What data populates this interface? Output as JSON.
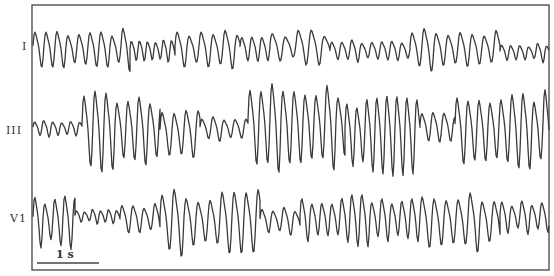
{
  "figure": {
    "background": "#ffffff",
    "trace_color": "#3a3a3a",
    "frame_color": "#444444",
    "frame": {
      "left": 32,
      "top": 5,
      "right": 549,
      "bottom": 270
    }
  },
  "leads": [
    {
      "label": "I",
      "label_pos": {
        "x": 22,
        "y": 40
      },
      "baseline_y": 48,
      "segments": [
        {
          "x0": 33,
          "x1": 130,
          "period": 11,
          "amp": 18,
          "bias": 0
        },
        {
          "x0": 130,
          "x1": 175,
          "period": 8,
          "amp": 10,
          "bias": 2
        },
        {
          "x0": 175,
          "x1": 240,
          "period": 12,
          "amp": 18,
          "bias": 0
        },
        {
          "x0": 240,
          "x1": 270,
          "period": 10,
          "amp": 12,
          "bias": 0
        },
        {
          "x0": 270,
          "x1": 330,
          "period": 13,
          "amp": 14,
          "bias": -2
        },
        {
          "x0": 330,
          "x1": 410,
          "period": 10,
          "amp": 9,
          "bias": 2
        },
        {
          "x0": 410,
          "x1": 500,
          "period": 12,
          "amp": 17,
          "bias": 0
        },
        {
          "x0": 500,
          "x1": 549,
          "period": 9,
          "amp": 8,
          "bias": 4
        }
      ]
    },
    {
      "label": "III",
      "label_pos": {
        "x": 6,
        "y": 124
      },
      "baseline_y": 128,
      "segments": [
        {
          "x0": 33,
          "x1": 82,
          "period": 9,
          "amp": 7,
          "bias": 0
        },
        {
          "x0": 82,
          "x1": 160,
          "period": 11,
          "amp": 36,
          "bias": 0
        },
        {
          "x0": 160,
          "x1": 200,
          "period": 12,
          "amp": 22,
          "bias": 4
        },
        {
          "x0": 200,
          "x1": 248,
          "period": 11,
          "amp": 10,
          "bias": 0
        },
        {
          "x0": 248,
          "x1": 345,
          "period": 11,
          "amp": 38,
          "bias": -4
        },
        {
          "x0": 345,
          "x1": 420,
          "period": 10,
          "amp": 32,
          "bias": 4
        },
        {
          "x0": 420,
          "x1": 455,
          "period": 11,
          "amp": 14,
          "bias": -2
        },
        {
          "x0": 455,
          "x1": 549,
          "period": 11,
          "amp": 34,
          "bias": 0
        }
      ]
    },
    {
      "label": "V1",
      "label_pos": {
        "x": 10,
        "y": 212
      },
      "baseline_y": 220,
      "segments": [
        {
          "x0": 33,
          "x1": 75,
          "period": 10,
          "amp": 26,
          "bias": 0
        },
        {
          "x0": 75,
          "x1": 120,
          "period": 8,
          "amp": 6,
          "bias": -4
        },
        {
          "x0": 120,
          "x1": 160,
          "period": 11,
          "amp": 14,
          "bias": -2
        },
        {
          "x0": 160,
          "x1": 260,
          "period": 12,
          "amp": 28,
          "bias": 0
        },
        {
          "x0": 260,
          "x1": 300,
          "period": 11,
          "amp": 12,
          "bias": 0
        },
        {
          "x0": 300,
          "x1": 420,
          "period": 10,
          "amp": 22,
          "bias": -2
        },
        {
          "x0": 420,
          "x1": 500,
          "period": 12,
          "amp": 26,
          "bias": 0
        },
        {
          "x0": 500,
          "x1": 549,
          "period": 10,
          "amp": 16,
          "bias": -4
        }
      ]
    }
  ],
  "scale_bar": {
    "label": "1 s",
    "x0": 37,
    "x1": 99,
    "y": 263,
    "label_pos": {
      "x": 56,
      "y": 248
    }
  }
}
